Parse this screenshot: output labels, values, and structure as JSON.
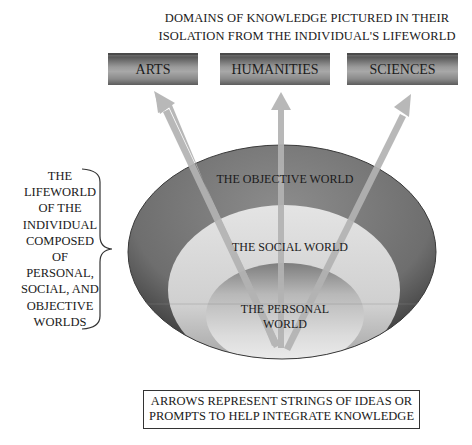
{
  "header": {
    "title_line1": "DOMAINS OF KNOWLEDGE  PICTURED IN THEIR",
    "title_line2": "ISOLATION FROM THE INDIVIDUAL'S LIFEWORLD"
  },
  "domains": [
    {
      "label": "ARTS"
    },
    {
      "label": "HUMANITIES"
    },
    {
      "label": "SCIENCES"
    }
  ],
  "lifeworld_label": {
    "lines": [
      "THE",
      "LIFEWORLD",
      "OF THE",
      "INDIVIDUAL",
      "COMPOSED",
      "OF",
      "PERSONAL,",
      "SOCIAL, AND",
      "OBJECTIVE",
      "WORLDS"
    ]
  },
  "worlds": {
    "objective": "THE OBJECTIVE WORLD",
    "social": "THE SOCIAL WORLD",
    "personal_line1": "THE PERSONAL",
    "personal_line2": "WORLD"
  },
  "note": {
    "line1": "ARROWS REPRESENT STRINGS OF IDEAS OR",
    "line2": "PROMPTS TO HELP INTEGRATE KNOWLEDGE"
  },
  "colors": {
    "objective_world": "#7a7a7a",
    "social_world": "#d2d2d2",
    "personal_world": "#c8c8c8",
    "arrow": "#b0b0b0",
    "domain_box": "#8a8a8a"
  }
}
